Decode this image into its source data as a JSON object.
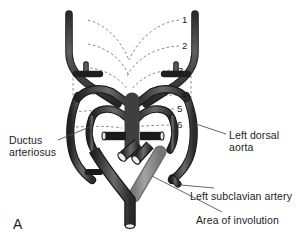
{
  "figure": {
    "panel_letter": "A",
    "background_color": "#ffffff",
    "vessel_dark_color": "#3b3b3b",
    "vessel_mid_color": "#585858",
    "involution_color": "#8d8d8d",
    "dashed_color": "#6f6f6f",
    "leader_color": "#4a4a4a",
    "text_color": "#1c1c1c"
  },
  "annotations": [
    {
      "id": "ductus-arteriosus",
      "text": "Ductus\narteriosus"
    },
    {
      "id": "left-dorsal-aorta",
      "text": "Left dorsal\naorta"
    },
    {
      "id": "left-subclavian-artery",
      "text": "Left subclavian artery"
    },
    {
      "id": "area-of-involution",
      "text": "Area of involution"
    }
  ],
  "arch_numbers": [
    {
      "id": "arch-1",
      "text": "1",
      "x": 182,
      "y": 20
    },
    {
      "id": "arch-2",
      "text": "2",
      "x": 182,
      "y": 46
    },
    {
      "id": "arch-3",
      "text": "3",
      "x": 178,
      "y": 71
    },
    {
      "id": "arch-4",
      "text": "4",
      "x": 181,
      "y": 95
    },
    {
      "id": "arch-5",
      "text": "5",
      "x": 177,
      "y": 108
    },
    {
      "id": "arch-6",
      "text": "6",
      "x": 177,
      "y": 124
    }
  ]
}
